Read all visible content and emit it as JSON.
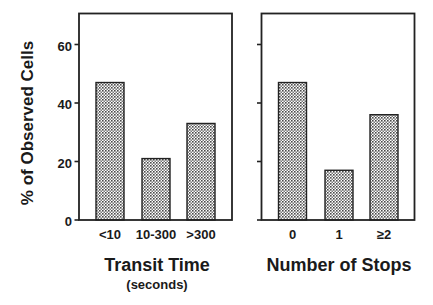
{
  "chart_data": [
    {
      "type": "bar",
      "title": "",
      "xlabel": "Transit Time",
      "xlabel_sub": "(seconds)",
      "ylabel": "% of Observed Cells",
      "categories": [
        "<10",
        "10-300",
        ">300"
      ],
      "values": [
        47,
        21,
        33
      ],
      "ylim": [
        0,
        70
      ],
      "yticks": [
        0,
        20,
        40,
        60
      ],
      "grid": false,
      "legend": null
    },
    {
      "type": "bar",
      "title": "",
      "xlabel": "Number of Stops",
      "xlabel_sub": "",
      "ylabel": "% of Observed Cells",
      "categories": [
        "0",
        "1",
        "≥2"
      ],
      "values": [
        47,
        17,
        36
      ],
      "ylim": [
        0,
        70
      ],
      "yticks": [
        0,
        20,
        40,
        60
      ],
      "yticklabels_shown": false,
      "grid": false,
      "legend": null
    }
  ],
  "figure": {
    "ylabel": "% of Observed Cells",
    "yticklabels": [
      "0",
      "20",
      "40",
      "60"
    ],
    "panels": [
      {
        "title": "Transit Time",
        "subtitle": "(seconds)",
        "categories": [
          "<10",
          "10-300",
          ">300"
        ]
      },
      {
        "title": "Number of Stops",
        "subtitle": "",
        "categories": [
          "0",
          "1",
          "≥2"
        ]
      }
    ]
  },
  "colors": {
    "ink": "#222222",
    "bar_fill_dark": "#5a5a5a",
    "bar_fill_light": "#ffffff",
    "background": "#ffffff"
  }
}
